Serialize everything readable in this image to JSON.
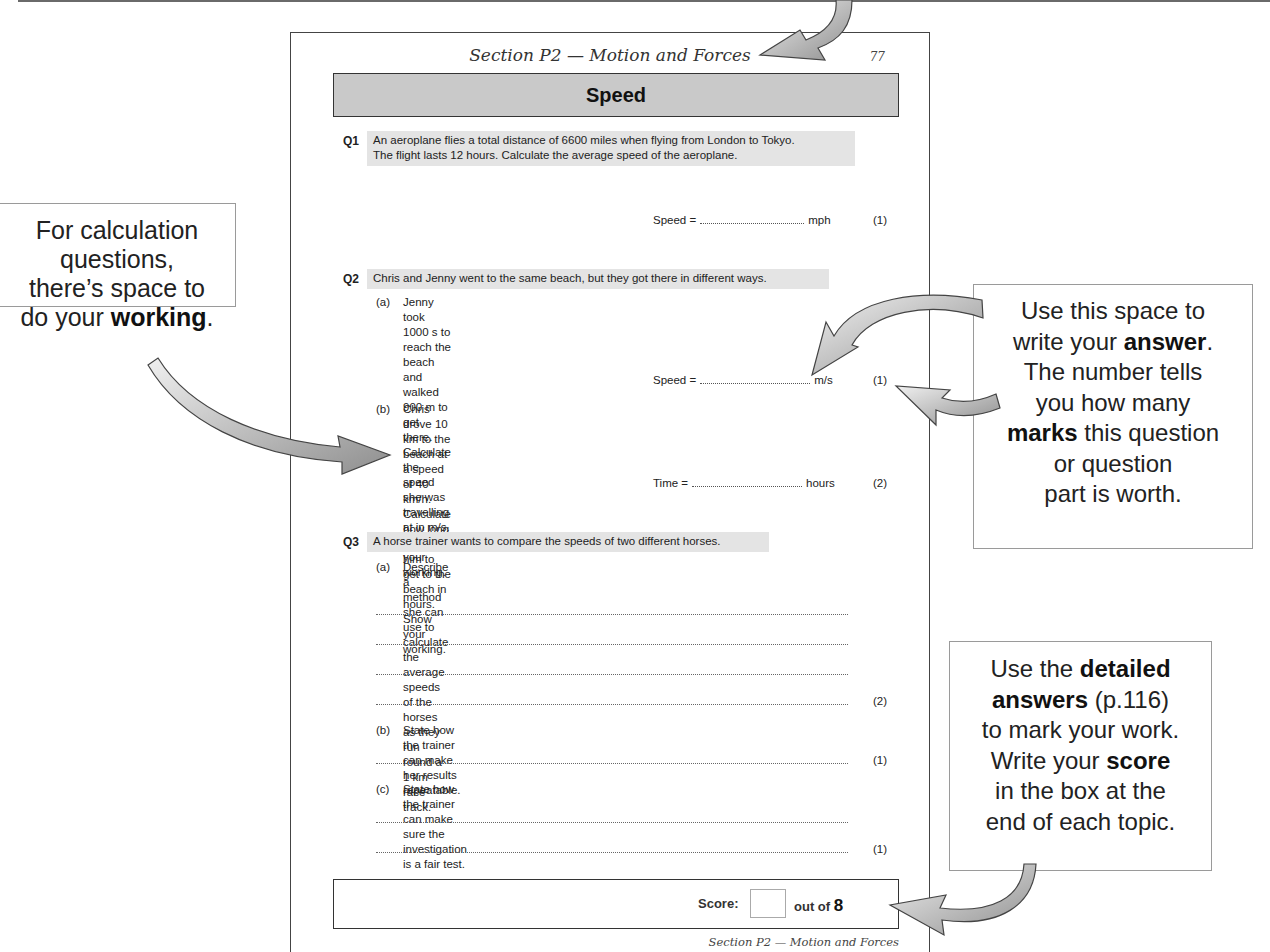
{
  "worksheet": {
    "running_head": "Section P2 — Motion and Forces",
    "page_number": "77",
    "topic_title": "Speed",
    "questions": [
      {
        "number": "Q1",
        "stem_lines": [
          "An aeroplane flies a total distance of 6600 miles when flying from London to Tokyo.",
          "The flight lasts 12 hours.  Calculate the average speed of the aeroplane."
        ],
        "answer": {
          "label": "Speed =",
          "unit": "mph",
          "marks": "(1)"
        }
      },
      {
        "number": "Q2",
        "stem_lines": [
          "Chris and Jenny went to the same beach, but they got there in different ways."
        ],
        "parts": [
          {
            "label": "(a)",
            "lines": [
              "Jenny took 1000 s to reach the beach and walked 900 m to get there.",
              "Calculate the speed she was travelling at in m/s.  Show your working."
            ],
            "answer": {
              "label": "Speed =",
              "unit": "m/s",
              "marks": "(1)"
            }
          },
          {
            "label": "(b)",
            "lines": [
              "Chris drove 10 km to the beach at a speed of 40 km/h.",
              "Calculate how long it took him to get to the beach in hours.  Show your working."
            ],
            "answer": {
              "label": "Time =",
              "unit": "hours",
              "marks": "(2)"
            }
          }
        ]
      },
      {
        "number": "Q3",
        "stem_lines": [
          "A horse trainer wants to compare the speeds of two different horses."
        ],
        "parts": [
          {
            "label": "(a)",
            "lines": [
              "Describe a method she can use to calculate the average speeds",
              "of the horses as they run round a 1 km race track."
            ],
            "marks": "(2)"
          },
          {
            "label": "(b)",
            "lines": [
              "State how the trainer can make her results repeatable."
            ],
            "marks": "(1)"
          },
          {
            "label": "(c)",
            "lines": [
              "State how the trainer can make sure the investigation is a fair test."
            ],
            "marks": "(1)"
          }
        ]
      }
    ],
    "score": {
      "label": "Score:",
      "out_of_label": "out of",
      "total": "8"
    },
    "running_foot": "Section P2 — Motion and Forces"
  },
  "callouts": {
    "working": {
      "line1": "For calculation",
      "line2": "questions,",
      "line3": "there’s space to",
      "line4_pre": "do your ",
      "line4_bold": "working",
      "line4_post": "."
    },
    "answer": {
      "line1": "Use this space to",
      "line2_pre": "write your ",
      "line2_bold": "answer",
      "line2_post": ".",
      "line3": "The number tells",
      "line4": "you how many",
      "line5_bold": "marks",
      "line5_post": " this question",
      "line6": "or question",
      "line7": "part is worth."
    },
    "score": {
      "line1_pre": "Use the ",
      "line1_bold": "detailed",
      "line2_bold": "answers",
      "line2_post": " (p.116)",
      "line3": "to mark your work.",
      "line4_pre": "Write your ",
      "line4_bold": "score",
      "line5": "in the box at the",
      "line6": "end of each topic."
    }
  },
  "colors": {
    "topic_bar": "#c9c9c9",
    "stem_highlight": "#e4e4e4",
    "arrow_fill_light": "#e6e6e6",
    "arrow_fill_dark": "#9a9a9a"
  }
}
